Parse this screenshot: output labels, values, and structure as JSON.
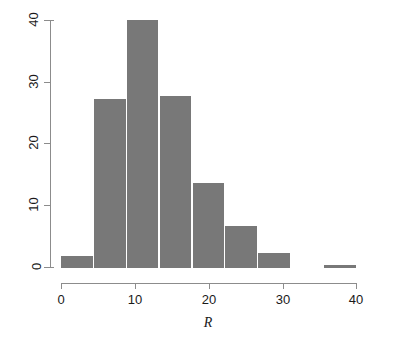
{
  "chart_data": {
    "type": "bar",
    "title": "",
    "subtitle": "",
    "xlabel": "R",
    "ylabel": "",
    "bin_width": 5,
    "xlim": [
      0,
      45
    ],
    "ylim": [
      0,
      41
    ],
    "grid": false,
    "legend": null,
    "bar_color": "#787878",
    "axis_color": "#8c8c8c",
    "x_ticks": [
      {
        "value": 0,
        "label": "0"
      },
      {
        "value": 10,
        "label": "10"
      },
      {
        "value": 20,
        "label": "20"
      },
      {
        "value": 30,
        "label": "30"
      },
      {
        "value": 40,
        "label": "40"
      }
    ],
    "y_ticks": [
      {
        "value": 0,
        "label": "0"
      },
      {
        "value": 10,
        "label": "10"
      },
      {
        "value": 20,
        "label": "20"
      },
      {
        "value": 30,
        "label": "30"
      },
      {
        "value": 40,
        "label": "40"
      }
    ],
    "bins": [
      {
        "x0": 0,
        "x1": 5,
        "label": "0-5",
        "value": 2
      },
      {
        "x0": 5,
        "x1": 10,
        "label": "5-10",
        "value": 28
      },
      {
        "x0": 10,
        "x1": 15,
        "label": "10-15",
        "value": 41
      },
      {
        "x0": 15,
        "x1": 20,
        "label": "15-20",
        "value": 28.5
      },
      {
        "x0": 20,
        "x1": 25,
        "label": "20-25",
        "value": 14
      },
      {
        "x0": 25,
        "x1": 30,
        "label": "25-30",
        "value": 7
      },
      {
        "x0": 30,
        "x1": 35,
        "label": "30-35",
        "value": 2.5
      },
      {
        "x0": 40,
        "x1": 45,
        "label": "40-45",
        "value": 0.5
      }
    ],
    "categories": [
      "0-5",
      "5-10",
      "10-15",
      "15-20",
      "20-25",
      "25-30",
      "30-35",
      "40-45"
    ],
    "values": [
      2,
      28,
      41,
      28.5,
      14,
      7,
      2.5,
      0.5
    ]
  }
}
